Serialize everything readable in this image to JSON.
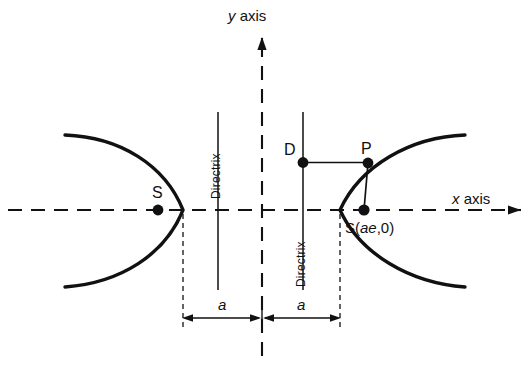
{
  "figure": {
    "type": "geometry-diagram",
    "background_color": "#ffffff",
    "stroke_color": "#111111",
    "width": 530,
    "height": 365
  },
  "axes": {
    "x": {
      "label_italic": "x",
      "label_rest": " axis",
      "style": "dashed-with-arrow",
      "y_position": 210,
      "x_start": 8,
      "x_end": 520
    },
    "y": {
      "label_italic": "y",
      "label_rest": " axis",
      "style": "dashed-with-arrow",
      "x_position": 262,
      "y_start": 355,
      "y_end": 38
    },
    "origin": {
      "x": 262,
      "y": 210
    }
  },
  "curves": {
    "left_branch": {
      "name": "left-hyperbola-branch",
      "vertex": {
        "x": 183,
        "y": 210
      },
      "opens": "left"
    },
    "right_branch": {
      "name": "right-hyperbola-branch",
      "vertex": {
        "x": 340,
        "y": 210
      },
      "opens": "right"
    }
  },
  "points": [
    {
      "id": "focus-left",
      "label": "S",
      "label_plain": "S",
      "x": 158,
      "y": 210,
      "label_position": "above"
    },
    {
      "id": "focus-right",
      "label_prefix": "S(",
      "label_italic": "ae",
      "label_suffix": ",0)",
      "x": 364,
      "y": 210,
      "label_position": "below"
    },
    {
      "id": "point-d",
      "label": "D",
      "x": 303,
      "y": 162,
      "label_position": "left"
    },
    {
      "id": "point-p",
      "label": "P",
      "x": 368,
      "y": 163,
      "label_position": "above"
    }
  ],
  "directrices": [
    {
      "id": "directrix-left",
      "label": "Directrix",
      "x": 218,
      "y_top": 112,
      "y_bottom": 290,
      "label_side": "above-axis"
    },
    {
      "id": "directrix-right",
      "label": "Directrix",
      "x": 303,
      "y_top": 112,
      "y_bottom": 290,
      "label_side": "below-axis"
    }
  ],
  "segments": [
    {
      "id": "segment-dp",
      "from": "point-d",
      "to": "point-p"
    },
    {
      "id": "segment-ps",
      "from": "point-p",
      "to": "focus-right"
    }
  ],
  "dimensions": [
    {
      "id": "dim-a-left",
      "label": "a",
      "from_x": 183,
      "to_x": 262,
      "y": 318,
      "label_x": 222,
      "label_y": 305
    },
    {
      "id": "dim-a-right",
      "label": "a",
      "from_x": 262,
      "to_x": 340,
      "y": 318,
      "label_x": 301,
      "label_y": 305
    }
  ],
  "extension_lines": [
    {
      "id": "ext-left-vertex",
      "x": 183,
      "y_top": 214,
      "y_bottom": 330
    },
    {
      "id": "ext-right-vertex",
      "x": 340,
      "y_top": 214,
      "y_bottom": 330
    }
  ]
}
